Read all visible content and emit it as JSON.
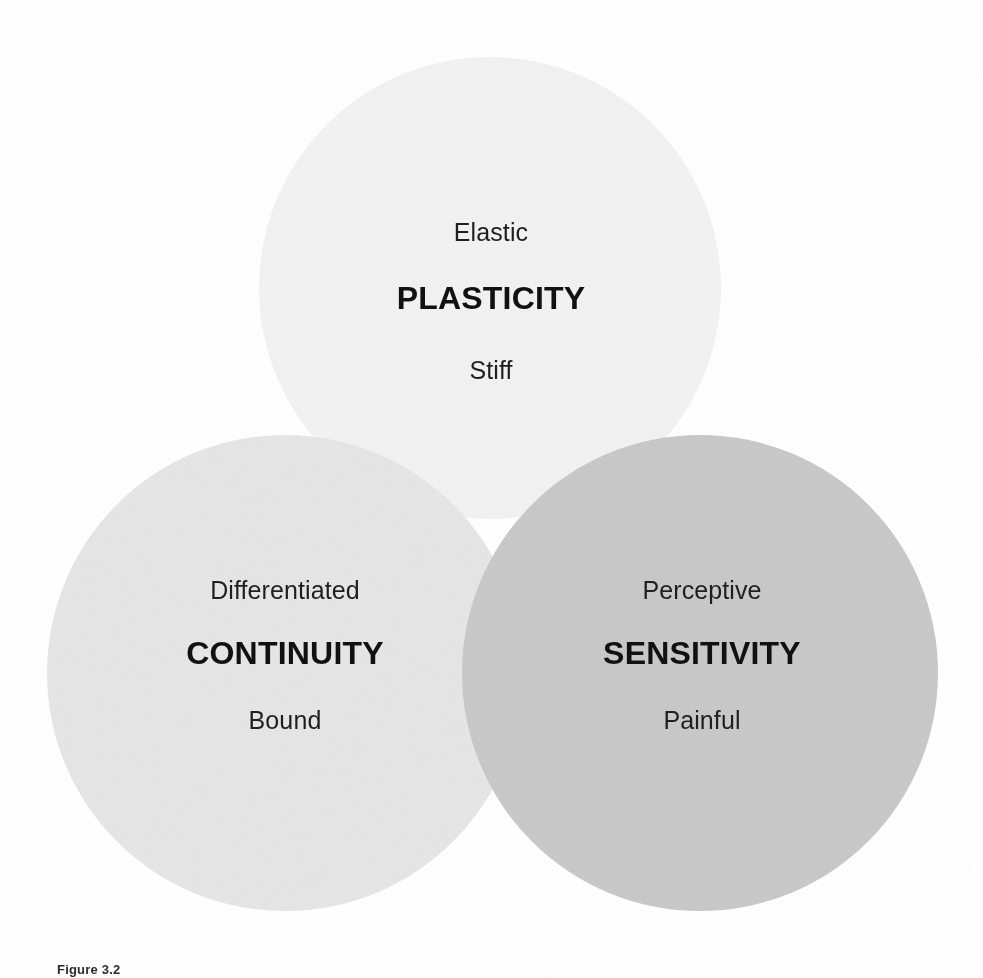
{
  "figure": {
    "caption": "Figure 3.2",
    "background_color": "#ffffff",
    "text_color": "#1a1a1a"
  },
  "diagram": {
    "type": "venn",
    "set_count": 3,
    "blend_mode": "multiply",
    "sets": [
      {
        "id": "plasticity",
        "title": "PLASTICITY",
        "pole_top": "Elastic",
        "pole_bottom": "Stiff",
        "fill_color": "#f2f2f2",
        "position": "top",
        "center_x": 490,
        "center_y": 288,
        "radius": 231
      },
      {
        "id": "continuity",
        "title": "CONTINUITY",
        "pole_top": "Differentiated",
        "pole_bottom": "Bound",
        "fill_color": "#e6e6e6",
        "position": "bottom-left",
        "center_x": 285,
        "center_y": 673,
        "radius": 238
      },
      {
        "id": "sensitivity",
        "title": "SENSITIVITY",
        "pole_top": "Perceptive",
        "pole_bottom": "Painful",
        "fill_color": "#c9c9c9",
        "position": "bottom-right",
        "center_x": 700,
        "center_y": 673,
        "radius": 238
      }
    ]
  }
}
